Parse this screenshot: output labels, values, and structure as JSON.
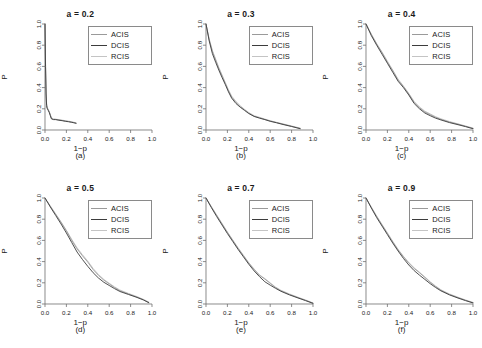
{
  "figure": {
    "panel_count": 6,
    "legend_entries": [
      "ACIS",
      "DCIS",
      "RCIS"
    ],
    "series_colors": {
      "ACIS": "#9a9a9a",
      "DCIS": "#3c3c3c",
      "RCIS": "#c4c4c4"
    },
    "axis_color": "#6e6e6e",
    "text_color": "#1a1a1a",
    "xlabel": "1−p",
    "ylabel": "P",
    "x_ticks": [
      "0.0",
      "0.2",
      "0.4",
      "0.6",
      "0.8",
      "1.0"
    ],
    "y_ticks": [
      "0.0",
      "0.2",
      "0.4",
      "0.6",
      "0.8",
      "1.0"
    ]
  },
  "chart_data": [
    {
      "type": "line",
      "title": "a = 0.2",
      "caption": "(a)",
      "xlabel": "1−p",
      "ylabel": "P",
      "xlim": [
        0,
        1
      ],
      "ylim": [
        0,
        1
      ],
      "x_ticks": [
        0.0,
        0.2,
        0.4,
        0.6,
        0.8,
        1.0
      ],
      "y_ticks": [
        0.0,
        0.2,
        0.4,
        0.6,
        0.8,
        1.0
      ],
      "grid": false,
      "legend_position": "top-right",
      "series": [
        {
          "name": "ACIS",
          "color": "#9a9a9a",
          "x": [
            0.0,
            0.005,
            0.01,
            0.015,
            0.02,
            0.03,
            0.04,
            0.05,
            0.06,
            0.08,
            0.1,
            0.13,
            0.16,
            0.19,
            0.22,
            0.25,
            0.27,
            0.29
          ],
          "y": [
            1.0,
            0.62,
            0.35,
            0.24,
            0.21,
            0.19,
            0.17,
            0.14,
            0.11,
            0.1,
            0.1,
            0.095,
            0.09,
            0.085,
            0.08,
            0.075,
            0.07,
            0.065
          ]
        },
        {
          "name": "DCIS",
          "color": "#3c3c3c",
          "x": [
            0.0,
            0.005,
            0.01,
            0.015,
            0.02,
            0.03,
            0.04,
            0.05,
            0.06,
            0.08,
            0.1,
            0.13,
            0.16,
            0.19,
            0.22,
            0.25,
            0.27,
            0.29
          ],
          "y": [
            1.0,
            0.6,
            0.34,
            0.23,
            0.205,
            0.185,
            0.165,
            0.135,
            0.105,
            0.098,
            0.098,
            0.092,
            0.088,
            0.082,
            0.078,
            0.072,
            0.068,
            0.063
          ]
        },
        {
          "name": "RCIS",
          "color": "#c4c4c4",
          "x": [
            0.0,
            0.005,
            0.01,
            0.015,
            0.02,
            0.03,
            0.04,
            0.05,
            0.06,
            0.08,
            0.1,
            0.13,
            0.16,
            0.19,
            0.22,
            0.25,
            0.27,
            0.29
          ],
          "y": [
            1.0,
            0.64,
            0.36,
            0.25,
            0.215,
            0.195,
            0.175,
            0.145,
            0.115,
            0.105,
            0.102,
            0.098,
            0.093,
            0.088,
            0.083,
            0.078,
            0.073,
            0.068
          ]
        }
      ]
    },
    {
      "type": "line",
      "title": "a = 0.3",
      "caption": "(b)",
      "xlabel": "1−p",
      "ylabel": "P",
      "xlim": [
        0,
        1
      ],
      "ylim": [
        0,
        1
      ],
      "x_ticks": [
        0.0,
        0.2,
        0.4,
        0.6,
        0.8,
        1.0
      ],
      "y_ticks": [
        0.0,
        0.2,
        0.4,
        0.6,
        0.8,
        1.0
      ],
      "grid": false,
      "legend_position": "top-right",
      "series": [
        {
          "name": "ACIS",
          "color": "#9a9a9a",
          "x": [
            0.0,
            0.03,
            0.06,
            0.09,
            0.12,
            0.15,
            0.18,
            0.21,
            0.24,
            0.28,
            0.32,
            0.36,
            0.4,
            0.45,
            0.5,
            0.55,
            0.6,
            0.66,
            0.72,
            0.8,
            0.88
          ],
          "y": [
            1.0,
            0.85,
            0.74,
            0.66,
            0.58,
            0.51,
            0.44,
            0.37,
            0.31,
            0.26,
            0.22,
            0.19,
            0.16,
            0.13,
            0.115,
            0.1,
            0.085,
            0.07,
            0.055,
            0.035,
            0.015
          ]
        },
        {
          "name": "DCIS",
          "color": "#3c3c3c",
          "x": [
            0.0,
            0.03,
            0.06,
            0.09,
            0.12,
            0.15,
            0.18,
            0.21,
            0.24,
            0.28,
            0.32,
            0.36,
            0.4,
            0.45,
            0.5,
            0.55,
            0.6,
            0.66,
            0.72,
            0.8,
            0.88
          ],
          "y": [
            1.0,
            0.84,
            0.72,
            0.64,
            0.565,
            0.495,
            0.43,
            0.36,
            0.3,
            0.25,
            0.215,
            0.185,
            0.155,
            0.128,
            0.112,
            0.098,
            0.082,
            0.068,
            0.052,
            0.033,
            0.012
          ]
        },
        {
          "name": "RCIS",
          "color": "#c4c4c4",
          "x": [
            0.0,
            0.03,
            0.06,
            0.09,
            0.12,
            0.15,
            0.18,
            0.21,
            0.24,
            0.28,
            0.32,
            0.36,
            0.4,
            0.45,
            0.5,
            0.55,
            0.6,
            0.66,
            0.72,
            0.8,
            0.88
          ],
          "y": [
            1.0,
            0.86,
            0.75,
            0.67,
            0.59,
            0.52,
            0.45,
            0.38,
            0.32,
            0.27,
            0.23,
            0.195,
            0.165,
            0.135,
            0.12,
            0.103,
            0.088,
            0.072,
            0.058,
            0.038,
            0.018
          ]
        }
      ]
    },
    {
      "type": "line",
      "title": "a = 0.4",
      "caption": "(c)",
      "xlabel": "1−p",
      "ylabel": "P",
      "xlim": [
        0,
        1
      ],
      "ylim": [
        0,
        1
      ],
      "x_ticks": [
        0.0,
        0.2,
        0.4,
        0.6,
        0.8,
        1.0
      ],
      "y_ticks": [
        0.0,
        0.2,
        0.4,
        0.6,
        0.8,
        1.0
      ],
      "grid": false,
      "legend_position": "top-right",
      "series": [
        {
          "name": "ACIS",
          "color": "#9a9a9a",
          "x": [
            0.0,
            0.05,
            0.1,
            0.15,
            0.2,
            0.25,
            0.3,
            0.35,
            0.4,
            0.45,
            0.5,
            0.55,
            0.6,
            0.65,
            0.7,
            0.78,
            0.86,
            0.93,
            1.0
          ],
          "y": [
            1.0,
            0.9,
            0.81,
            0.73,
            0.64,
            0.56,
            0.47,
            0.41,
            0.34,
            0.26,
            0.21,
            0.17,
            0.145,
            0.12,
            0.1,
            0.075,
            0.055,
            0.035,
            0.015
          ]
        },
        {
          "name": "DCIS",
          "color": "#3c3c3c",
          "x": [
            0.0,
            0.05,
            0.1,
            0.15,
            0.2,
            0.25,
            0.3,
            0.35,
            0.4,
            0.45,
            0.5,
            0.55,
            0.6,
            0.65,
            0.7,
            0.78,
            0.86,
            0.93,
            1.0
          ],
          "y": [
            1.0,
            0.89,
            0.8,
            0.715,
            0.63,
            0.545,
            0.46,
            0.4,
            0.33,
            0.25,
            0.2,
            0.16,
            0.135,
            0.112,
            0.095,
            0.07,
            0.05,
            0.032,
            0.012
          ]
        },
        {
          "name": "RCIS",
          "color": "#c4c4c4",
          "x": [
            0.0,
            0.05,
            0.1,
            0.15,
            0.2,
            0.25,
            0.3,
            0.35,
            0.4,
            0.45,
            0.5,
            0.55,
            0.6,
            0.65,
            0.7,
            0.78,
            0.86,
            0.93,
            1.0
          ],
          "y": [
            1.0,
            0.905,
            0.815,
            0.735,
            0.65,
            0.565,
            0.48,
            0.415,
            0.345,
            0.27,
            0.218,
            0.178,
            0.152,
            0.126,
            0.106,
            0.08,
            0.058,
            0.038,
            0.018
          ]
        }
      ]
    },
    {
      "type": "line",
      "title": "a = 0.5",
      "caption": "(d)",
      "xlabel": "1−p",
      "ylabel": "P",
      "xlim": [
        0,
        1
      ],
      "ylim": [
        0,
        1
      ],
      "x_ticks": [
        0.0,
        0.2,
        0.4,
        0.6,
        0.8,
        1.0
      ],
      "y_ticks": [
        0.0,
        0.2,
        0.4,
        0.6,
        0.8,
        1.0
      ],
      "grid": false,
      "legend_position": "top-right",
      "series": [
        {
          "name": "ACIS",
          "color": "#9a9a9a",
          "x": [
            0.0,
            0.05,
            0.1,
            0.15,
            0.2,
            0.25,
            0.3,
            0.35,
            0.4,
            0.45,
            0.5,
            0.55,
            0.6,
            0.65,
            0.7,
            0.78,
            0.86,
            0.92,
            0.97
          ],
          "y": [
            1.0,
            0.92,
            0.845,
            0.77,
            0.69,
            0.6,
            0.52,
            0.455,
            0.395,
            0.325,
            0.27,
            0.225,
            0.19,
            0.155,
            0.125,
            0.095,
            0.065,
            0.04,
            0.015
          ]
        },
        {
          "name": "DCIS",
          "color": "#3c3c3c",
          "x": [
            0.0,
            0.05,
            0.1,
            0.15,
            0.2,
            0.25,
            0.3,
            0.35,
            0.4,
            0.45,
            0.5,
            0.55,
            0.6,
            0.65,
            0.7,
            0.78,
            0.86,
            0.92,
            0.97
          ],
          "y": [
            1.0,
            0.915,
            0.835,
            0.755,
            0.67,
            0.58,
            0.49,
            0.42,
            0.355,
            0.295,
            0.245,
            0.205,
            0.175,
            0.145,
            0.118,
            0.09,
            0.062,
            0.038,
            0.012
          ]
        },
        {
          "name": "RCIS",
          "color": "#c4c4c4",
          "x": [
            0.0,
            0.05,
            0.1,
            0.15,
            0.2,
            0.25,
            0.3,
            0.35,
            0.4,
            0.45,
            0.5,
            0.55,
            0.6,
            0.65,
            0.7,
            0.78,
            0.86,
            0.92,
            0.97
          ],
          "y": [
            1.0,
            0.925,
            0.85,
            0.775,
            0.695,
            0.61,
            0.53,
            0.465,
            0.405,
            0.335,
            0.278,
            0.232,
            0.196,
            0.162,
            0.132,
            0.1,
            0.07,
            0.044,
            0.018
          ]
        }
      ]
    },
    {
      "type": "line",
      "title": "a = 0.7",
      "caption": "(e)",
      "xlabel": "1−p",
      "ylabel": "P",
      "xlim": [
        0,
        1
      ],
      "ylim": [
        0,
        1
      ],
      "x_ticks": [
        0.0,
        0.2,
        0.4,
        0.6,
        0.8,
        1.0
      ],
      "y_ticks": [
        0.0,
        0.2,
        0.4,
        0.6,
        0.8,
        1.0
      ],
      "grid": false,
      "legend_position": "top-right",
      "series": [
        {
          "name": "ACIS",
          "color": "#9a9a9a",
          "x": [
            0.0,
            0.05,
            0.1,
            0.15,
            0.2,
            0.25,
            0.3,
            0.35,
            0.4,
            0.45,
            0.5,
            0.55,
            0.6,
            0.65,
            0.7,
            0.78,
            0.86,
            0.93,
            1.0
          ],
          "y": [
            1.0,
            0.915,
            0.835,
            0.755,
            0.675,
            0.6,
            0.525,
            0.455,
            0.385,
            0.325,
            0.27,
            0.235,
            0.195,
            0.155,
            0.125,
            0.09,
            0.06,
            0.035,
            0.008
          ]
        },
        {
          "name": "DCIS",
          "color": "#3c3c3c",
          "x": [
            0.0,
            0.05,
            0.1,
            0.15,
            0.2,
            0.25,
            0.3,
            0.35,
            0.4,
            0.45,
            0.5,
            0.55,
            0.6,
            0.65,
            0.7,
            0.78,
            0.86,
            0.93,
            1.0
          ],
          "y": [
            1.0,
            0.91,
            0.825,
            0.745,
            0.665,
            0.59,
            0.515,
            0.445,
            0.375,
            0.312,
            0.258,
            0.21,
            0.178,
            0.148,
            0.12,
            0.086,
            0.057,
            0.032,
            0.006
          ]
        },
        {
          "name": "RCIS",
          "color": "#c4c4c4",
          "x": [
            0.0,
            0.05,
            0.1,
            0.15,
            0.2,
            0.25,
            0.3,
            0.35,
            0.4,
            0.45,
            0.5,
            0.55,
            0.6,
            0.65,
            0.7,
            0.78,
            0.86,
            0.93,
            1.0
          ],
          "y": [
            1.0,
            0.92,
            0.84,
            0.76,
            0.68,
            0.605,
            0.53,
            0.46,
            0.39,
            0.33,
            0.275,
            0.24,
            0.2,
            0.16,
            0.13,
            0.095,
            0.064,
            0.038,
            0.01
          ]
        }
      ]
    },
    {
      "type": "line",
      "title": "a = 0.9",
      "caption": "(f)",
      "xlabel": "1−p",
      "ylabel": "P",
      "xlim": [
        0,
        1
      ],
      "ylim": [
        0,
        1
      ],
      "x_ticks": [
        0.0,
        0.2,
        0.4,
        0.6,
        0.8,
        1.0
      ],
      "y_ticks": [
        0.0,
        0.2,
        0.4,
        0.6,
        0.8,
        1.0
      ],
      "grid": false,
      "legend_position": "top-right",
      "series": [
        {
          "name": "ACIS",
          "color": "#9a9a9a",
          "x": [
            0.0,
            0.05,
            0.1,
            0.15,
            0.2,
            0.25,
            0.3,
            0.35,
            0.4,
            0.45,
            0.5,
            0.55,
            0.6,
            0.65,
            0.7,
            0.78,
            0.86,
            0.93,
            1.0
          ],
          "y": [
            1.0,
            0.91,
            0.825,
            0.745,
            0.665,
            0.585,
            0.51,
            0.445,
            0.385,
            0.335,
            0.295,
            0.25,
            0.205,
            0.165,
            0.13,
            0.09,
            0.06,
            0.035,
            0.012
          ]
        },
        {
          "name": "DCIS",
          "color": "#3c3c3c",
          "x": [
            0.0,
            0.05,
            0.1,
            0.15,
            0.2,
            0.25,
            0.3,
            0.35,
            0.4,
            0.45,
            0.5,
            0.55,
            0.6,
            0.65,
            0.7,
            0.78,
            0.86,
            0.93,
            1.0
          ],
          "y": [
            1.0,
            0.905,
            0.815,
            0.735,
            0.655,
            0.575,
            0.5,
            0.43,
            0.368,
            0.315,
            0.272,
            0.232,
            0.192,
            0.156,
            0.124,
            0.086,
            0.056,
            0.032,
            0.01
          ]
        },
        {
          "name": "RCIS",
          "color": "#c4c4c4",
          "x": [
            0.0,
            0.05,
            0.1,
            0.15,
            0.2,
            0.25,
            0.3,
            0.35,
            0.4,
            0.45,
            0.5,
            0.55,
            0.6,
            0.65,
            0.7,
            0.78,
            0.86,
            0.93,
            1.0
          ],
          "y": [
            1.0,
            0.915,
            0.83,
            0.75,
            0.672,
            0.592,
            0.516,
            0.45,
            0.392,
            0.342,
            0.3,
            0.256,
            0.21,
            0.17,
            0.135,
            0.095,
            0.064,
            0.038,
            0.015
          ]
        }
      ]
    }
  ]
}
